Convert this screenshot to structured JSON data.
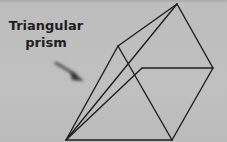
{
  "diagram": {
    "label_line1": "Triangular",
    "label_line2": "prism",
    "shape": "triangular-prism-wireframe",
    "colors": {
      "background": "#bdbdbd",
      "line": "#1f1f1f",
      "arrow": "#3a3a3a"
    }
  }
}
